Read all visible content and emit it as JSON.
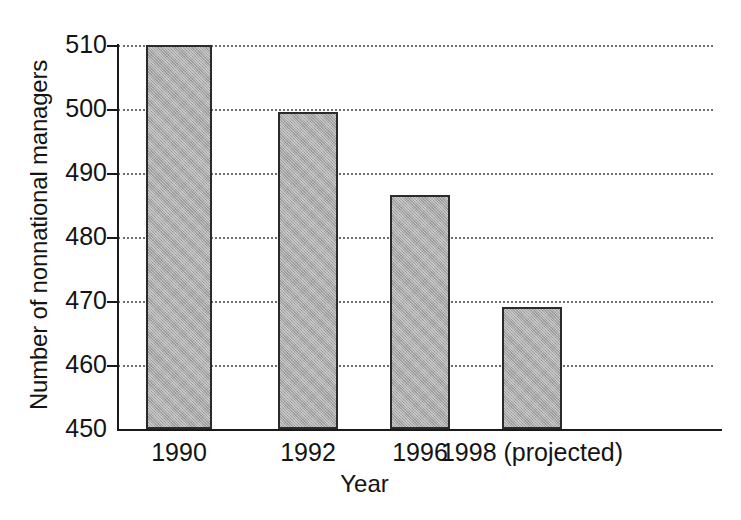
{
  "chart_data": {
    "type": "bar",
    "title": "",
    "subtitle": "",
    "xlabel": "Year",
    "ylabel": "Number of nonnational managers",
    "categories": [
      "1990",
      "1992",
      "1996",
      "1998 (projected)"
    ],
    "values": [
      510,
      499.5,
      486.5,
      469
    ],
    "series": [
      {
        "name": "Number of nonnational managers",
        "values": [
          510,
          499.5,
          486.5,
          469
        ]
      }
    ],
    "ylim": [
      450,
      510
    ],
    "xlim": null,
    "yticks": [
      450,
      460,
      470,
      480,
      490,
      500,
      510
    ],
    "ytick_labels": [
      "450",
      "460",
      "470",
      "480",
      "490",
      "500",
      "510"
    ],
    "xtick_labels": [
      "1990",
      "1992",
      "1996",
      "1998 (projected)"
    ],
    "grid": "horizontal-dotted",
    "legend": "none",
    "legend_position": "none",
    "annotations": [],
    "bar_fill_color": "#a9a9a9",
    "bar_edge_color": "#2b2b2b",
    "gridline_color": "#6e6e6e",
    "axis_color": "#1a1a1a",
    "background_color": "#ffffff"
  },
  "axes": {
    "y_title": "Number of nonnational managers",
    "x_title": "Year",
    "y_ticks": [
      {
        "label": "510",
        "value": 510
      },
      {
        "label": "500",
        "value": 500
      },
      {
        "label": "490",
        "value": 490
      },
      {
        "label": "480",
        "value": 480
      },
      {
        "label": "470",
        "value": 470
      },
      {
        "label": "460",
        "value": 460
      },
      {
        "label": "450",
        "value": 450
      }
    ],
    "x_ticks": [
      {
        "label": "1990"
      },
      {
        "label": "1992"
      },
      {
        "label": "1996"
      },
      {
        "label": "1998 (projected)"
      }
    ]
  }
}
